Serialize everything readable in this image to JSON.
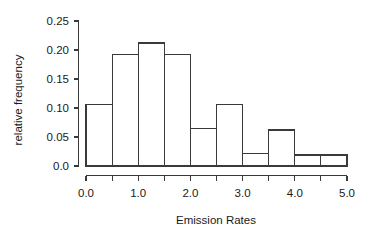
{
  "chart_data": {
    "type": "bar",
    "title": "",
    "subtitle": "",
    "xlabel": "Emission Rates",
    "ylabel": "relative frequency",
    "xlim": [
      0.0,
      5.0
    ],
    "ylim": [
      0.0,
      0.25
    ],
    "grid": false,
    "legend": null,
    "bin_width": 0.5,
    "bin_edges": [
      0.0,
      0.5,
      1.0,
      1.5,
      2.0,
      2.5,
      3.0,
      3.5,
      4.0,
      4.5,
      5.0
    ],
    "categories": [
      "0.0-0.5",
      "0.5-1.0",
      "1.0-1.5",
      "1.5-2.0",
      "2.0-2.5",
      "2.5-3.0",
      "3.0-3.5",
      "3.5-4.0",
      "4.0-4.5",
      "4.5-5.0"
    ],
    "values": [
      0.106,
      0.192,
      0.212,
      0.192,
      0.064,
      0.106,
      0.021,
      0.062,
      0.019,
      0.019
    ],
    "xticks": [
      0.0,
      0.5,
      1.0,
      1.5,
      2.0,
      2.5,
      3.0,
      3.5,
      4.0,
      4.5,
      5.0
    ],
    "xtick_labels": [
      "0.0",
      "",
      "1.0",
      "",
      "2.0",
      "",
      "3.0",
      "",
      "4.0",
      "",
      "5.0"
    ],
    "yticks": [
      0.0,
      0.05,
      0.1,
      0.15,
      0.2,
      0.25
    ],
    "ytick_labels": [
      "0.0",
      "0.05",
      "0.10",
      "0.15",
      "0.20",
      "0.25"
    ]
  },
  "figure": {
    "background_color": "#ffffff",
    "line_color": "#3a3a3a",
    "bar_fill_color": "#ffffff",
    "text_color": "#1a1a1a"
  }
}
